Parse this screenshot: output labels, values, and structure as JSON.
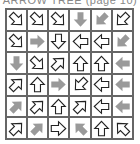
{
  "title": "ARROW TREE (page 10)",
  "colors": {
    "outline": "#222222",
    "filled": "#9a9a9a",
    "grid": "#666666"
  },
  "grid": {
    "rows": 6,
    "cols": 6,
    "cells": [
      [
        {
          "dir": "se",
          "style": "outline"
        },
        {
          "dir": "se",
          "style": "outline"
        },
        {
          "dir": "se",
          "style": "outline"
        },
        {
          "dir": "s",
          "style": "filled"
        },
        {
          "dir": "sw",
          "style": "filled"
        },
        {
          "dir": "sw",
          "style": "outline"
        }
      ],
      [
        {
          "dir": "se",
          "style": "outline"
        },
        {
          "dir": "e",
          "style": "filled"
        },
        {
          "dir": "s",
          "style": "outline"
        },
        {
          "dir": "w",
          "style": "outline"
        },
        {
          "dir": "w",
          "style": "outline"
        },
        {
          "dir": "sw",
          "style": "filled"
        }
      ],
      [
        {
          "dir": "s",
          "style": "filled"
        },
        {
          "dir": "se",
          "style": "outline"
        },
        {
          "dir": "ne",
          "style": "outline"
        },
        {
          "dir": "n",
          "style": "outline"
        },
        {
          "dir": "n",
          "style": "outline"
        },
        {
          "dir": "w",
          "style": "filled"
        }
      ],
      [
        {
          "dir": "ne",
          "style": "outline"
        },
        {
          "dir": "n",
          "style": "outline"
        },
        {
          "dir": "e",
          "style": "filled"
        },
        {
          "dir": "sw",
          "style": "outline"
        },
        {
          "dir": "w",
          "style": "outline"
        },
        {
          "dir": "w",
          "style": "filled"
        }
      ],
      [
        {
          "dir": "ne",
          "style": "filled"
        },
        {
          "dir": "ne",
          "style": "outline"
        },
        {
          "dir": "n",
          "style": "outline"
        },
        {
          "dir": "ne",
          "style": "outline"
        },
        {
          "dir": "w",
          "style": "outline"
        },
        {
          "dir": "w",
          "style": "filled"
        }
      ],
      [
        {
          "dir": "ne",
          "style": "outline"
        },
        {
          "dir": "ne",
          "style": "filled"
        },
        {
          "dir": "e",
          "style": "outline"
        },
        {
          "dir": "nw",
          "style": "filled"
        },
        {
          "dir": "n",
          "style": "outline"
        },
        {
          "dir": "nw",
          "style": "outline"
        }
      ]
    ]
  }
}
